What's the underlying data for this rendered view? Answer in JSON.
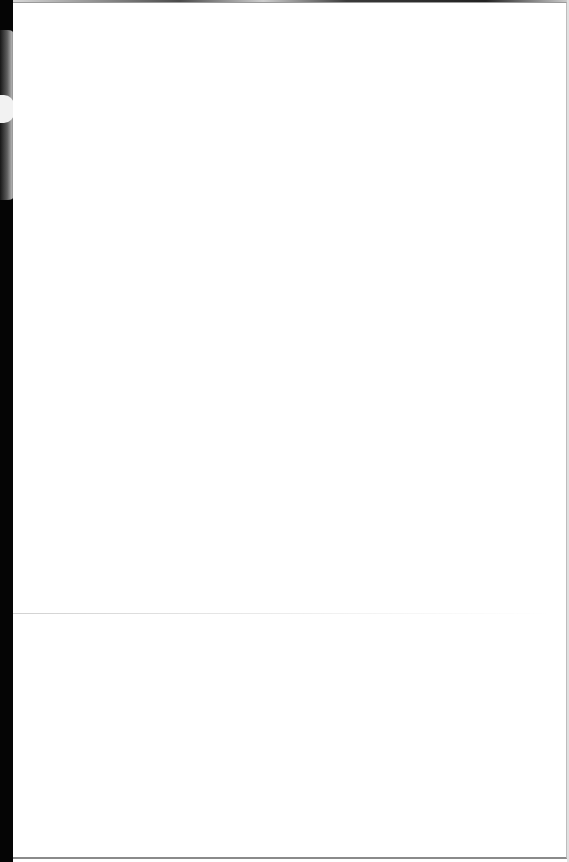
{
  "document": {
    "type": "scanned-page",
    "content_text": "",
    "is_blank": true,
    "colors": {
      "paper": "#ffffff",
      "scan_bed": "#050505",
      "edge_shadow": "#8a8a8a",
      "fold_line": "#bebebe"
    }
  }
}
